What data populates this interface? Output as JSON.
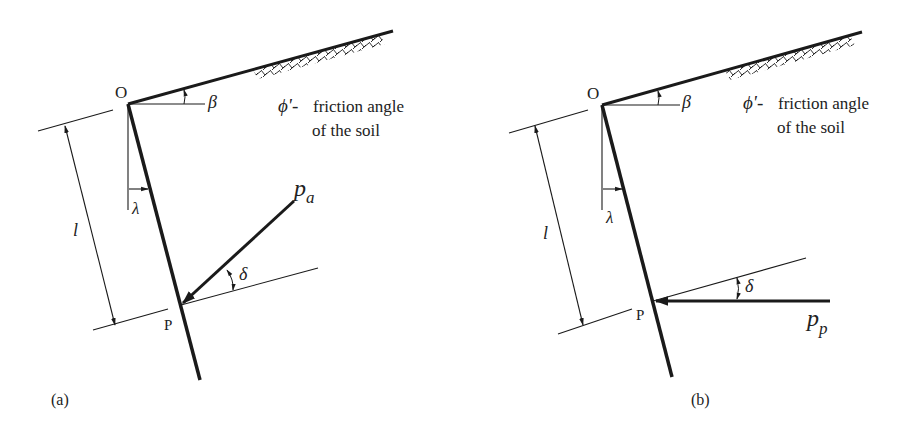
{
  "figure": {
    "type": "earth-pressure-on-retaining-wall",
    "panels": [
      {
        "id": "a",
        "caption": "(a)",
        "point_top": "O",
        "point_bottom": "P",
        "angle_backfill": "β",
        "angle_wall": "λ",
        "length": "l",
        "friction_symbol": "ϕ'-",
        "friction_line1": "friction angle",
        "friction_line2": "of the soil",
        "force_symbol": "p",
        "force_subscript": "a",
        "force_angle": "δ",
        "force_name": "active thrust"
      },
      {
        "id": "b",
        "caption": "(b)",
        "point_top": "O",
        "point_bottom": "P",
        "angle_backfill": "β",
        "angle_wall": "λ",
        "length": "l",
        "friction_symbol": "ϕ'-",
        "friction_line1": "friction angle",
        "friction_line2": "of the soil",
        "force_symbol": "p",
        "force_subscript": "p",
        "force_angle": "δ",
        "force_name": "passive thrust"
      }
    ],
    "colors": {
      "line": "#1a1a1a",
      "text": "#222222",
      "background": "#ffffff"
    }
  }
}
